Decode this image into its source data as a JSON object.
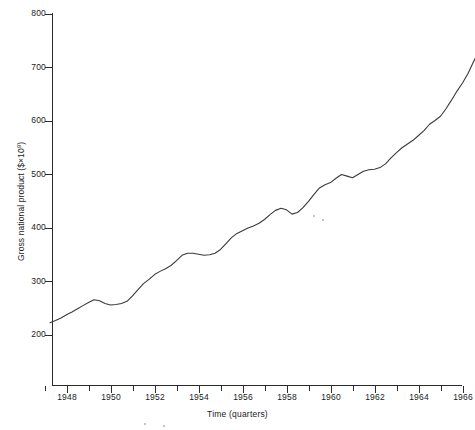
{
  "chart_data": {
    "type": "line",
    "title": "",
    "xlabel": "Time (quarters)",
    "ylabel": "Gross national product ($×10⁹)",
    "ylabel_text": "Gross national product ($×10",
    "ylabel_exp": "9",
    "ylabel_tail": ")",
    "grid": false,
    "legend": "none",
    "xlim": [
      1947.25,
      1967.0
    ],
    "ylim": [
      170,
      810
    ],
    "y_ticks": [
      200,
      300,
      400,
      500,
      600,
      700,
      800
    ],
    "y_tick_labels": [
      "200",
      "300",
      "400",
      "500",
      "600",
      "700",
      "800"
    ],
    "x_ticks_major": [
      1948,
      1950,
      1952,
      1954,
      1956,
      1958,
      1960,
      1962,
      1964,
      1966
    ],
    "x_tick_labels": [
      "1948",
      "1950",
      "1952",
      "1954",
      "1956",
      "1958",
      "1960",
      "1962",
      "1964",
      "1966"
    ],
    "x_ticks_minor": [
      1947,
      1949,
      1951,
      1953,
      1955,
      1957,
      1959,
      1961,
      1963,
      1965,
      1967
    ],
    "series": [
      {
        "name": "Gross national product",
        "color": "#3a3a3a",
        "x": [
          1947.25,
          1947.5,
          1947.75,
          1948.0,
          1948.25,
          1948.5,
          1948.75,
          1949.0,
          1949.25,
          1949.5,
          1949.75,
          1950.0,
          1950.25,
          1950.5,
          1950.75,
          1951.0,
          1951.25,
          1951.5,
          1951.75,
          1952.0,
          1952.25,
          1952.5,
          1952.75,
          1953.0,
          1953.25,
          1953.5,
          1953.75,
          1954.0,
          1954.25,
          1954.5,
          1954.75,
          1955.0,
          1955.25,
          1955.5,
          1955.75,
          1956.0,
          1956.25,
          1956.5,
          1956.75,
          1957.0,
          1957.25,
          1957.5,
          1957.75,
          1958.0,
          1958.25,
          1958.5,
          1958.75,
          1959.0,
          1959.25,
          1959.5,
          1959.75,
          1960.0,
          1960.25,
          1960.5,
          1960.75,
          1961.0,
          1961.25,
          1961.5,
          1961.75,
          1962.0,
          1962.25,
          1962.5,
          1962.75,
          1963.0,
          1963.25,
          1963.5,
          1963.75,
          1964.0,
          1964.25,
          1964.5,
          1964.75,
          1965.0,
          1965.25,
          1965.5,
          1965.75,
          1966.0,
          1966.25,
          1966.5,
          1966.75
        ],
        "y": [
          222,
          226,
          231,
          237,
          242,
          248,
          254,
          260,
          265,
          263,
          258,
          255,
          256,
          258,
          262,
          272,
          284,
          295,
          303,
          312,
          318,
          323,
          329,
          338,
          348,
          352,
          352,
          350,
          348,
          349,
          352,
          359,
          370,
          381,
          389,
          394,
          399,
          403,
          408,
          415,
          424,
          432,
          436,
          433,
          425,
          428,
          437,
          449,
          462,
          474,
          480,
          484,
          492,
          499,
          496,
          493,
          499,
          505,
          508,
          509,
          512,
          519,
          530,
          540,
          549,
          556,
          563,
          572,
          581,
          593,
          600,
          608,
          622,
          638,
          655,
          670,
          688,
          710,
          730
        ]
      }
    ],
    "final_value": 772
  }
}
